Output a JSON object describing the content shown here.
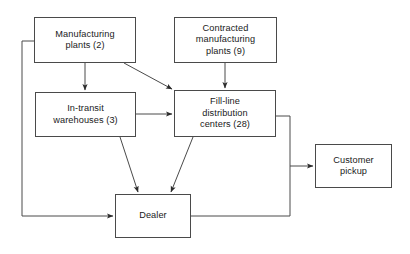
{
  "diagram": {
    "type": "flowchart",
    "background_color": "#ffffff",
    "line_color": "#4a4a4a",
    "text_color": "#1a1a1a",
    "nodes": [
      {
        "id": "manufacturing-plants",
        "label": "Manufacturing\nplants (2)",
        "count": 2,
        "x": 34,
        "y": 17,
        "w": 102,
        "h": 46
      },
      {
        "id": "contracted-manufacturing-plants",
        "label": "Contracted\nmanufacturing\nplants (9)",
        "count": 9,
        "x": 174,
        "y": 17,
        "w": 103,
        "h": 46
      },
      {
        "id": "in-transit-warehouses",
        "label": "In-transit\nwarehouses (3)",
        "count": 3,
        "x": 35,
        "y": 92,
        "w": 101,
        "h": 45
      },
      {
        "id": "fill-line-distribution-centers",
        "label": "Fill-line\ndistribution\ncenters (28)",
        "count": 28,
        "x": 174,
        "y": 90,
        "w": 102,
        "h": 47
      },
      {
        "id": "customer-pickup",
        "label": "Customer\npickup",
        "count": null,
        "x": 315,
        "y": 144,
        "w": 77,
        "h": 44
      },
      {
        "id": "dealer",
        "label": "Dealer",
        "count": null,
        "x": 115,
        "y": 194,
        "w": 76,
        "h": 44
      }
    ],
    "edges": [
      {
        "id": "manufacturing-to-warehouses",
        "from": "manufacturing-plants",
        "to": "in-transit-warehouses",
        "arrow": true,
        "points": "85,63 85,90"
      },
      {
        "id": "manufacturing-to-fill-line",
        "from": "manufacturing-plants",
        "to": "fill-line-distribution-centers",
        "arrow": true,
        "points": "124,63 172,89"
      },
      {
        "id": "contracted-to-fill-line",
        "from": "contracted-manufacturing-plants",
        "to": "fill-line-distribution-centers",
        "arrow": true,
        "points": "225,63 225,88"
      },
      {
        "id": "warehouses-to-fill-line",
        "from": "in-transit-warehouses",
        "to": "fill-line-distribution-centers",
        "arrow": true,
        "points": "136,114 172,114"
      },
      {
        "id": "warehouses-to-dealer",
        "from": "in-transit-warehouses",
        "to": "dealer",
        "arrow": true,
        "points": "120,137 138,192"
      },
      {
        "id": "fill-line-to-dealer",
        "from": "fill-line-distribution-centers",
        "to": "dealer",
        "arrow": true,
        "points": "193,137 171,192"
      },
      {
        "id": "fill-line-to-customer-pickup",
        "from": "fill-line-distribution-centers",
        "to": "customer-pickup",
        "arrow": true,
        "points": "276,116 290,116 290,166 313,166"
      },
      {
        "id": "dealer-to-fill-line-return",
        "from": "dealer",
        "to": "fill-line-distribution-centers",
        "arrow": false,
        "points": "191,216 290,216 290,166"
      },
      {
        "id": "manufacturing-to-dealer-loop",
        "from": "manufacturing-plants",
        "to": "dealer",
        "arrow": true,
        "points": "34,41 22,41 22,216 113,216"
      }
    ]
  }
}
